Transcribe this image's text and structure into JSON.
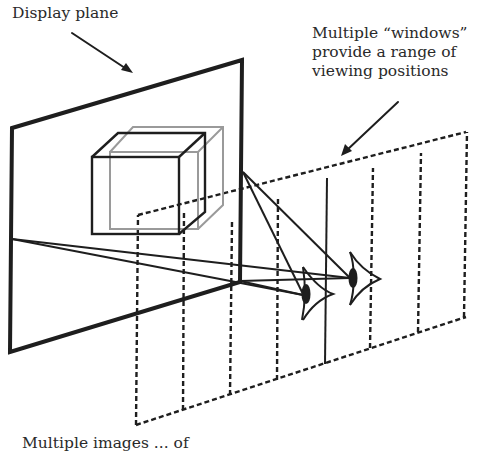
{
  "labels": {
    "display_plane": "Display plane",
    "windows_line1": "Multiple “windows”",
    "windows_line2": "provide a range of",
    "windows_line3": "viewing positions",
    "bottom_partial": "Multiple images ... of"
  },
  "colors": {
    "ink": "#1e1e1e",
    "ghost_cube": "#9a9a9a",
    "background": "#ffffff"
  },
  "elements": {
    "display_plane": "solid quadrilateral",
    "cube_front": "dark wireframe cube",
    "cube_ghost": "light gray offset wireframe cube",
    "windows_plane": "dashed parallelogram divided into vertical viewing windows",
    "eyes": [
      "left eye",
      "right eye"
    ]
  }
}
